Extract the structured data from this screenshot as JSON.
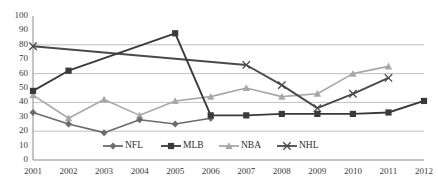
{
  "chart_data": {
    "type": "line",
    "title": "",
    "subtitle": "",
    "xlabel": "",
    "ylabel": "",
    "x": [
      2001,
      2002,
      2003,
      2004,
      2005,
      2006,
      2007,
      2008,
      2009,
      2010,
      2011,
      2012
    ],
    "xticklabels": [
      "2001",
      "2002",
      "2003",
      "2004",
      "2005",
      "2006",
      "2007",
      "2008",
      "2009",
      "2010",
      "2011",
      "2012"
    ],
    "yticklabels": [
      "0",
      "10",
      "20",
      "30",
      "40",
      "50",
      "60",
      "70",
      "80",
      "90",
      "100"
    ],
    "ylim": [
      0,
      100
    ],
    "ytick_step": 10,
    "xlim": [
      2001,
      2012
    ],
    "grid": "horizontal-major-only",
    "gridline_values": [
      20,
      40,
      60,
      80
    ],
    "legend_position": "inside-bottom-center",
    "series": [
      {
        "name": "NFL",
        "marker": "diamond",
        "color": "#6b6b6b",
        "x": [
          2001,
          2002,
          2003,
          2004,
          2005,
          2006
        ],
        "values": [
          33,
          25,
          19,
          28,
          25,
          29
        ]
      },
      {
        "name": "MLB",
        "marker": "square",
        "color": "#3a3a3a",
        "x": [
          2001,
          2002,
          2005,
          2006,
          2007,
          2008,
          2009,
          2010,
          2011,
          2012
        ],
        "values": [
          48,
          62,
          88,
          31,
          31,
          32,
          32,
          32,
          33,
          41
        ]
      },
      {
        "name": "NBA",
        "marker": "triangle",
        "color": "#a8a8a8",
        "x": [
          2001,
          2002,
          2003,
          2004,
          2005,
          2006,
          2007,
          2008,
          2009,
          2010,
          2011
        ],
        "values": [
          45,
          29,
          42,
          31,
          41,
          44,
          50,
          44,
          46,
          60,
          65
        ]
      },
      {
        "name": "NHL",
        "marker": "x",
        "color": "#4a4a4a",
        "x": [
          2001,
          2007,
          2008,
          2009,
          2010,
          2011
        ],
        "values": [
          79,
          66,
          52,
          36,
          46,
          57
        ]
      }
    ],
    "legend": [
      {
        "label": "NFL",
        "marker": "diamond",
        "color": "#6b6b6b"
      },
      {
        "label": "MLB",
        "marker": "square",
        "color": "#3a3a3a"
      },
      {
        "label": "NBA",
        "marker": "triangle",
        "color": "#a8a8a8"
      },
      {
        "label": "NHL",
        "marker": "x",
        "color": "#4a4a4a"
      }
    ]
  },
  "axes": {
    "y_labels": [
      "100",
      "90",
      "80",
      "70",
      "60",
      "50",
      "40",
      "30",
      "20",
      "10",
      "0"
    ],
    "x_labels": [
      "2001",
      "2002",
      "2003",
      "2004",
      "2005",
      "2006",
      "2007",
      "2008",
      "2009",
      "2010",
      "2011",
      "2012"
    ]
  },
  "colors": {
    "nfl": "#6b6b6b",
    "mlb": "#3a3a3a",
    "nba": "#a8a8a8",
    "nhl": "#4a4a4a",
    "gridline": "#b9b9b9",
    "axis": "#8a8a8a",
    "text": "#3a3a3a",
    "background": "#ffffff"
  }
}
